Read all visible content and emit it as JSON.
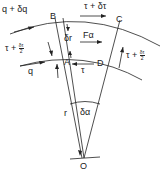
{
  "diagram": {
    "title": "",
    "points": {
      "B": "B",
      "C": "C",
      "A": "A",
      "D": "D",
      "O": "O"
    },
    "labels": {
      "q_plus_dq": "q + δq",
      "q": "q",
      "tau_plus_dtau": "τ + δτ",
      "tau": "τ",
      "tau_plus_half_left": "τ +",
      "tau_plus_half_right": "τ +",
      "half_num": "δτ",
      "half_den": "2",
      "delta_r": "δr",
      "F_alpha": "Fα",
      "r": "r",
      "delta_alpha": "δα"
    },
    "colors": {
      "line": "#222222",
      "background": "#ffffff"
    }
  }
}
